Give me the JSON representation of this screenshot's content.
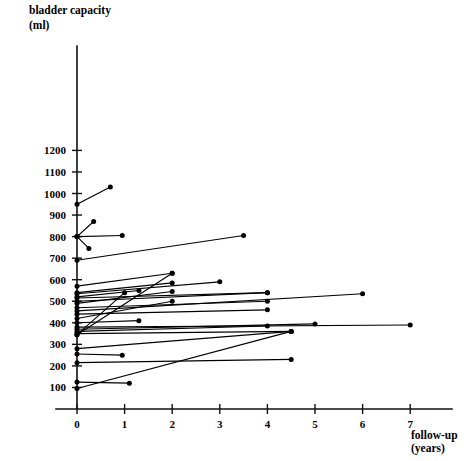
{
  "chart_data": {
    "type": "line",
    "title": "bladder capacity (ml)",
    "title_line1": "bladder capacity",
    "title_line2": "(ml)",
    "xlabel_line1": "follow-up",
    "xlabel_line2": "(years)",
    "ylabel": "bladder capacity (ml)",
    "xlim": [
      0,
      7.35
    ],
    "ylim": [
      0,
      1260
    ],
    "grid": false,
    "legend": "none",
    "xticks": [
      0,
      1,
      2,
      3,
      4,
      5,
      6,
      7
    ],
    "xtick_labels": [
      "0",
      "1",
      "2",
      "3",
      "4",
      "5",
      "6",
      "7"
    ],
    "yticks": [
      100,
      200,
      300,
      400,
      500,
      600,
      700,
      800,
      900,
      1000,
      1100,
      1200
    ],
    "ytick_labels": [
      "100",
      "200",
      "300",
      "400",
      "500",
      "600",
      "700",
      "800",
      "900",
      "1000",
      "1100",
      "1200"
    ],
    "series": [
      {
        "name": "patient-01",
        "x": [
          0.0,
          0.7
        ],
        "values": [
          950,
          1030
        ]
      },
      {
        "name": "patient-02",
        "x": [
          0.0,
          0.35
        ],
        "values": [
          800,
          870
        ]
      },
      {
        "name": "patient-03",
        "x": [
          0.0,
          0.95
        ],
        "values": [
          800,
          805
        ]
      },
      {
        "name": "patient-04",
        "x": [
          0.0,
          0.25
        ],
        "values": [
          800,
          745
        ]
      },
      {
        "name": "patient-05",
        "x": [
          0.0,
          3.5
        ],
        "values": [
          690,
          805
        ]
      },
      {
        "name": "patient-06",
        "x": [
          0.0,
          2.0
        ],
        "values": [
          570,
          630
        ]
      },
      {
        "name": "patient-07",
        "x": [
          0.0,
          2.0
        ],
        "values": [
          540,
          585
        ]
      },
      {
        "name": "patient-08",
        "x": [
          0.0,
          3.0
        ],
        "values": [
          535,
          590
        ]
      },
      {
        "name": "patient-09",
        "x": [
          0.0,
          1.3
        ],
        "values": [
          520,
          550
        ]
      },
      {
        "name": "patient-10",
        "x": [
          0.0,
          4.0
        ],
        "values": [
          515,
          540
        ]
      },
      {
        "name": "patient-11",
        "x": [
          0.0,
          4.0
        ],
        "values": [
          500,
          540
        ]
      },
      {
        "name": "patient-12",
        "x": [
          0.0,
          2.0
        ],
        "values": [
          490,
          545
        ]
      },
      {
        "name": "patient-13",
        "x": [
          0.0,
          4.0
        ],
        "values": [
          470,
          500
        ]
      },
      {
        "name": "patient-14",
        "x": [
          0.0,
          6.0
        ],
        "values": [
          455,
          535
        ]
      },
      {
        "name": "patient-15",
        "x": [
          0.0,
          4.0
        ],
        "values": [
          440,
          460
        ]
      },
      {
        "name": "patient-16",
        "x": [
          0.0,
          2.0
        ],
        "values": [
          420,
          500
        ]
      },
      {
        "name": "patient-17",
        "x": [
          0.0,
          1.3
        ],
        "values": [
          400,
          410
        ]
      },
      {
        "name": "patient-18",
        "x": [
          0.0,
          7.0
        ],
        "values": [
          380,
          390
        ]
      },
      {
        "name": "patient-19",
        "x": [
          0.0,
          5.0
        ],
        "values": [
          370,
          395
        ]
      },
      {
        "name": "patient-20",
        "x": [
          0.0,
          4.0
        ],
        "values": [
          360,
          385
        ]
      },
      {
        "name": "patient-21",
        "x": [
          0.0,
          4.5
        ],
        "values": [
          350,
          360
        ]
      },
      {
        "name": "patient-22",
        "x": [
          0.0,
          1.0
        ],
        "values": [
          345,
          540
        ]
      },
      {
        "name": "patient-23",
        "x": [
          0.0,
          2.0
        ],
        "values": [
          345,
          630
        ]
      },
      {
        "name": "patient-24",
        "x": [
          0.0,
          4.5
        ],
        "values": [
          280,
          360
        ]
      },
      {
        "name": "patient-25",
        "x": [
          0.0,
          0.95
        ],
        "values": [
          255,
          250
        ]
      },
      {
        "name": "patient-26",
        "x": [
          0.0,
          4.5
        ],
        "values": [
          215,
          230
        ]
      },
      {
        "name": "patient-27",
        "x": [
          0.0,
          1.1
        ],
        "values": [
          125,
          120
        ]
      },
      {
        "name": "patient-28",
        "x": [
          0.0,
          4.5
        ],
        "values": [
          95,
          360
        ]
      }
    ]
  }
}
